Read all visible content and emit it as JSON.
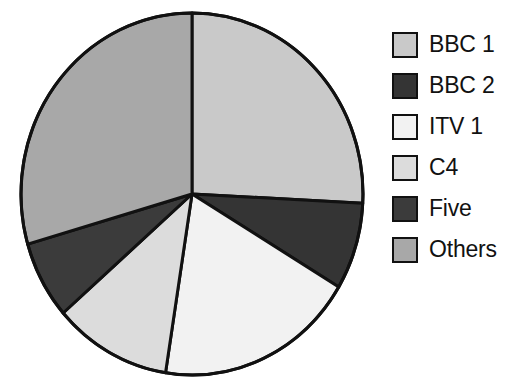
{
  "chart_data": {
    "type": "pie",
    "title": "",
    "subtitle": "",
    "xlabel": "",
    "ylabel": "",
    "legend_position": "right",
    "grid": false,
    "start_angle_deg": 0,
    "direction": "clockwise",
    "categories": [
      "BBC 1",
      "BBC 2",
      "ITV 1",
      "C4",
      "Five",
      "Others"
    ],
    "values": [
      25.8,
      7.8,
      18.9,
      11.1,
      6.9,
      29.5
    ],
    "unit": "percent",
    "slices": [
      {
        "label": "BBC 1",
        "value": 25.8,
        "start_deg": 0.0,
        "end_deg": 92.9,
        "color": "#c9c9c9",
        "stroke": "#111111"
      },
      {
        "label": "BBC 2",
        "value": 7.8,
        "start_deg": 92.9,
        "end_deg": 120.9,
        "color": "#343434",
        "stroke": "#111111"
      },
      {
        "label": "ITV 1",
        "value": 18.9,
        "start_deg": 120.9,
        "end_deg": 188.9,
        "color": "#f2f2f2",
        "stroke": "#111111"
      },
      {
        "label": "C4",
        "value": 11.1,
        "start_deg": 188.9,
        "end_deg": 228.9,
        "color": "#dcdcdc",
        "stroke": "#111111"
      },
      {
        "label": "Five",
        "value": 6.9,
        "start_deg": 228.9,
        "end_deg": 253.9,
        "color": "#3b3b3b",
        "stroke": "#111111"
      },
      {
        "label": "Others",
        "value": 29.5,
        "start_deg": 253.9,
        "end_deg": 360.0,
        "color": "#a8a8a8",
        "stroke": "#111111"
      }
    ]
  },
  "legend": {
    "items": [
      {
        "label": "BBC 1",
        "color": "#c9c9c9"
      },
      {
        "label": "BBC 2",
        "color": "#343434"
      },
      {
        "label": "ITV 1",
        "color": "#f2f2f2"
      },
      {
        "label": "C4",
        "color": "#dcdcdc"
      },
      {
        "label": "Five",
        "color": "#3b3b3b"
      },
      {
        "label": "Others",
        "color": "#a8a8a8"
      }
    ]
  },
  "geometry": {
    "center_x": 192,
    "center_y": 194,
    "radius_x": 171,
    "radius_y": 181
  }
}
